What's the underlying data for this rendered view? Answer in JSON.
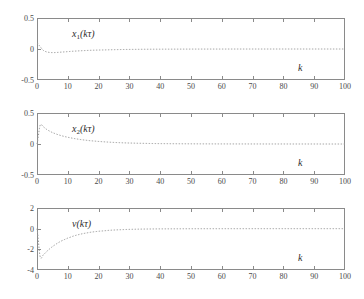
{
  "figure": {
    "background": "#ffffff",
    "axis_color": "#8a8a8a",
    "curve_color": "#9a9a9a",
    "text_color": "#3a3a3a",
    "panel_count": 3
  },
  "chart_data": [
    {
      "type": "line",
      "title": "",
      "signal_label": "x1(kτ)",
      "signal_base": "x",
      "signal_sub": "1",
      "signal_arg": "(kτ)",
      "xlabel": "k",
      "ylabel": "",
      "xlim": [
        0,
        100
      ],
      "ylim": [
        -0.5,
        0.5
      ],
      "xticks": [
        0,
        10,
        20,
        30,
        40,
        50,
        60,
        70,
        80,
        90,
        100
      ],
      "xticklabels": [
        "0",
        "10",
        "20",
        "30",
        "40",
        "50",
        "60",
        "70",
        "80",
        "90",
        "100"
      ],
      "yticks": [
        0.5,
        0,
        -0.5
      ],
      "yticklabels": [
        "0.5",
        "0",
        "-0.5"
      ],
      "grid": false,
      "linestyle": "dotted",
      "x": [
        0,
        1,
        2,
        3,
        4,
        5,
        6,
        7,
        8,
        9,
        10,
        12,
        14,
        16,
        18,
        20,
        24,
        28,
        32,
        36,
        40,
        50,
        60,
        70,
        80,
        90,
        100
      ],
      "y": [
        0.1,
        0.04,
        -0.02,
        -0.045,
        -0.055,
        -0.058,
        -0.057,
        -0.054,
        -0.05,
        -0.046,
        -0.042,
        -0.035,
        -0.029,
        -0.024,
        -0.02,
        -0.017,
        -0.012,
        -0.008,
        -0.006,
        -0.004,
        -0.003,
        -0.0015,
        -0.0008,
        -0.0004,
        -0.0002,
        -0.0001,
        0.0
      ]
    },
    {
      "type": "line",
      "title": "",
      "signal_label": "x2(kτ)",
      "signal_base": "x",
      "signal_sub": "2",
      "signal_arg": "(kτ)",
      "xlabel": "k",
      "ylabel": "",
      "xlim": [
        0,
        100
      ],
      "ylim": [
        -0.5,
        0.5
      ],
      "xticks": [
        0,
        10,
        20,
        30,
        40,
        50,
        60,
        70,
        80,
        90,
        100
      ],
      "xticklabels": [
        "0",
        "10",
        "20",
        "30",
        "40",
        "50",
        "60",
        "70",
        "80",
        "90",
        "100"
      ],
      "yticks": [
        0.5,
        0,
        -0.5
      ],
      "yticklabels": [
        "0.5",
        "0",
        "-0.5"
      ],
      "grid": false,
      "linestyle": "dotted",
      "x": [
        0,
        1,
        2,
        3,
        4,
        5,
        6,
        7,
        8,
        9,
        10,
        12,
        14,
        16,
        18,
        20,
        24,
        28,
        32,
        36,
        40,
        50,
        60,
        70,
        80,
        90,
        100
      ],
      "y": [
        0.0,
        0.3,
        0.28,
        0.24,
        0.21,
        0.185,
        0.165,
        0.148,
        0.133,
        0.12,
        0.108,
        0.089,
        0.073,
        0.06,
        0.05,
        0.041,
        0.028,
        0.019,
        0.013,
        0.009,
        0.006,
        0.003,
        0.0014,
        0.0007,
        0.0003,
        0.0001,
        0.0
      ]
    },
    {
      "type": "line",
      "title": "",
      "signal_label": "v(kτ)",
      "signal_base": "v",
      "signal_sub": "",
      "signal_arg": "(kτ)",
      "xlabel": "k",
      "ylabel": "",
      "xlim": [
        0,
        100
      ],
      "ylim": [
        -4,
        2
      ],
      "xticks": [
        0,
        10,
        20,
        30,
        40,
        50,
        60,
        70,
        80,
        90,
        100
      ],
      "xticklabels": [
        "0",
        "10",
        "20",
        "30",
        "40",
        "50",
        "60",
        "70",
        "80",
        "90",
        "100"
      ],
      "yticks": [
        2,
        0,
        -2,
        -4
      ],
      "yticklabels": [
        "2",
        "0",
        "-2",
        "-4"
      ],
      "grid": false,
      "linestyle": "dotted",
      "x": [
        0,
        1,
        2,
        3,
        4,
        5,
        6,
        7,
        8,
        9,
        10,
        12,
        14,
        16,
        18,
        20,
        24,
        28,
        32,
        36,
        40,
        50,
        60,
        70,
        80,
        90,
        100
      ],
      "y": [
        0.0,
        -2.7,
        -2.55,
        -2.25,
        -1.98,
        -1.74,
        -1.53,
        -1.34,
        -1.18,
        -1.04,
        -0.91,
        -0.7,
        -0.54,
        -0.42,
        -0.32,
        -0.25,
        -0.15,
        -0.09,
        -0.055,
        -0.033,
        -0.02,
        -0.006,
        -0.002,
        -0.0008,
        -0.0003,
        -0.0001,
        0.0
      ]
    }
  ]
}
